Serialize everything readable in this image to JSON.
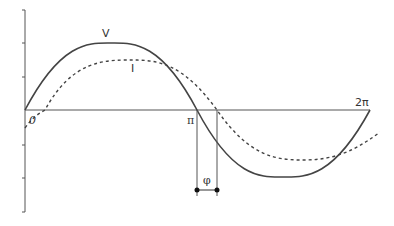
{
  "diagram": {
    "title": "",
    "curves": [
      {
        "name": "V",
        "label": "V",
        "style": "solid",
        "color": "#444444",
        "amplitude": 1.0,
        "phase_shift": 0
      },
      {
        "name": "I",
        "label": "I",
        "style": "dashed",
        "color": "#444444",
        "amplitude": 0.75,
        "phase_shift": "φ"
      }
    ],
    "x_axis": {
      "labels": {
        "origin": "0",
        "pi": "π",
        "two_pi": "2π"
      }
    },
    "y_axis": {
      "tick_count": 7
    },
    "phase_marker": {
      "label": "φ"
    },
    "colors": {
      "line": "#444444",
      "axis": "#555555",
      "background": "#ffffff"
    }
  }
}
